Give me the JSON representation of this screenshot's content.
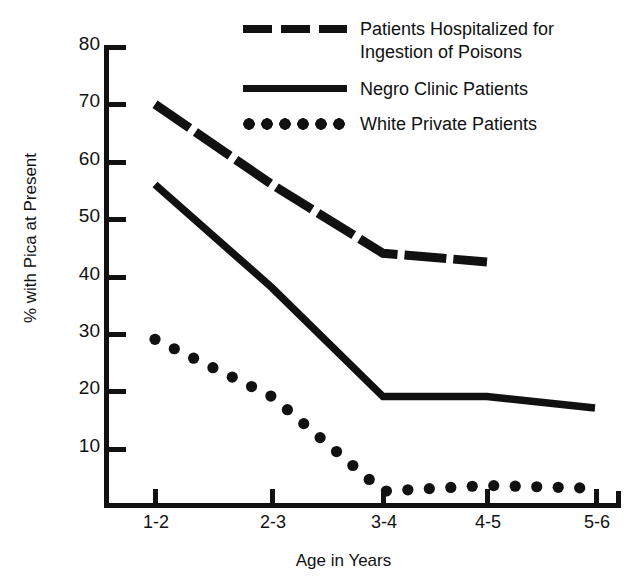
{
  "chart_data": {
    "type": "line",
    "title": "",
    "xlabel": "Age in Years",
    "ylabel": "% with Pica at Present",
    "categories": [
      "1-2",
      "2-3",
      "3-4",
      "4-5",
      "5-6"
    ],
    "ylim": [
      0,
      80
    ],
    "yticks": [
      10,
      20,
      30,
      40,
      50,
      60,
      70,
      80
    ],
    "grid": false,
    "legend_position": "top-right",
    "series": [
      {
        "name": "Patients Hospitalized for Ingestion of Poisons",
        "legend_label": "Patients Hospitalized for\nIngestion of Poisons",
        "style": "dashed",
        "color": "#111111",
        "values": [
          70,
          56,
          44,
          42.5,
          null
        ]
      },
      {
        "name": "Negro Clinic Patients",
        "legend_label": "Negro Clinic Patients",
        "style": "solid",
        "color": "#111111",
        "values": [
          56,
          38,
          19,
          19,
          17
        ]
      },
      {
        "name": "White Private Patients",
        "legend_label": "White Private Patients",
        "style": "dotted",
        "color": "#111111",
        "values": [
          29,
          19,
          2.5,
          3.5,
          3
        ]
      }
    ]
  },
  "axis": {
    "ytick_labels": [
      "80",
      "70",
      "60",
      "50",
      "40",
      "30",
      "20",
      "10"
    ],
    "xtick_labels": [
      "1-2",
      "2-3",
      "3-4",
      "4-5",
      "5-6"
    ]
  }
}
